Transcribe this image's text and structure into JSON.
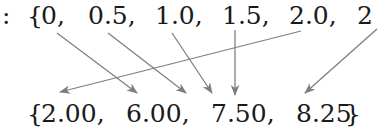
{
  "figure": {
    "type": "set-mapping-diagram",
    "background_color": "#ffffff",
    "text_color": "#1a1a1a",
    "arrow_color": "#808080",
    "width": 383,
    "height": 133
  },
  "domain_row": {
    "label_prefix": ":",
    "open_brace": "{",
    "items": [
      {
        "text": "0,",
        "x": 41
      },
      {
        "text": "0.5,",
        "x": 88
      },
      {
        "text": "1.0,",
        "x": 155
      },
      {
        "text": "1.5,",
        "x": 222
      },
      {
        "text": "2.0,",
        "x": 289
      },
      {
        "text": "2",
        "x": 357
      }
    ],
    "truncated_right": true
  },
  "codomain_row": {
    "open_brace": "{",
    "close_brace": "}",
    "items": [
      {
        "text": "2.00,",
        "x": 41
      },
      {
        "text": "6.00,",
        "x": 126
      },
      {
        "text": "7.50,",
        "x": 211
      },
      {
        "text": "8.25",
        "x": 296
      }
    ]
  },
  "arrows": [
    {
      "name": "arrow-1",
      "x1": 57,
      "y1": 33,
      "x2": 137,
      "y2": 93
    },
    {
      "name": "arrow-2",
      "x1": 108,
      "y1": 33,
      "x2": 186,
      "y2": 93
    },
    {
      "name": "arrow-3",
      "x1": 172,
      "y1": 33,
      "x2": 212,
      "y2": 93
    },
    {
      "name": "arrow-4",
      "x1": 235,
      "y1": 30,
      "x2": 235,
      "y2": 95
    },
    {
      "name": "arrow-5",
      "x1": 301,
      "y1": 31,
      "x2": 60,
      "y2": 92
    },
    {
      "name": "arrow-6",
      "x1": 377,
      "y1": 29,
      "x2": 305,
      "y2": 93
    }
  ],
  "chart_data": {
    "type": "diagram",
    "domain_values": [
      "0",
      "0.5",
      "1.0",
      "1.5",
      "2.0",
      "2"
    ],
    "codomain_values": [
      "2.00",
      "6.00",
      "7.50",
      "8.25"
    ],
    "arrow_count": 6,
    "convergence_point": {
      "x": 235,
      "y": 62
    }
  }
}
